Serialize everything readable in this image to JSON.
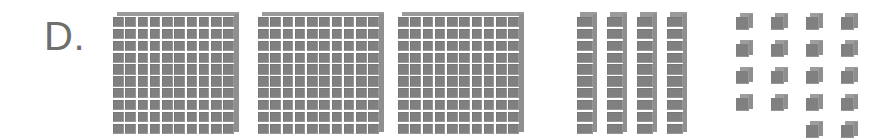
{
  "page": {
    "background_color": "#ffffff",
    "width": 872,
    "height": 139
  },
  "label": {
    "text": "D.",
    "color": "#6e6e6e"
  },
  "colors": {
    "block_face": "#808080",
    "block_top_shade": "#9a9a9a",
    "block_side_shade": "#8f8f8f",
    "gridline": "#ffffff"
  },
  "manipulative": {
    "type": "base-ten-blocks",
    "groups": [
      {
        "name": "hundreds",
        "piece": "flat",
        "count": 3,
        "cells_per_piece": 100,
        "rows_per_piece": 10,
        "cols_per_piece": 10,
        "value_per_piece": 100,
        "subtotal": 300,
        "positions_x": [
          113,
          258,
          398
        ],
        "position_y": 12
      },
      {
        "name": "tens",
        "piece": "rod",
        "count": 4,
        "cells_per_piece": 10,
        "rows_per_piece": 10,
        "cols_per_piece": 1,
        "value_per_piece": 10,
        "subtotal": 40,
        "positions_x": [
          577,
          607,
          637,
          667
        ],
        "position_y": 12
      },
      {
        "name": "ones",
        "piece": "unit",
        "count": 18,
        "cells_per_piece": 1,
        "value_per_piece": 1,
        "subtotal": 18,
        "grid": {
          "origin_x": 736,
          "origin_y": 13,
          "step_x": 35,
          "step_y": 27,
          "rows": [
            [
              1,
              1,
              1,
              1
            ],
            [
              1,
              1,
              1,
              1
            ],
            [
              1,
              1,
              1,
              1
            ],
            [
              1,
              1,
              1,
              1
            ],
            [
              0,
              0,
              1,
              1
            ]
          ]
        }
      }
    ],
    "total_value": 358
  }
}
